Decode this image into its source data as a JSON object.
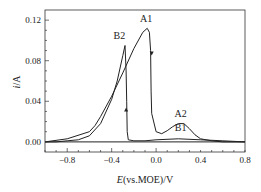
{
  "chart_data": {
    "type": "line",
    "title": "",
    "xlabel": "E(vs.MOE)/V",
    "xlabel_italic": "E",
    "xlabel_rest": "(vs.MOE)/V",
    "ylabel": "i/A",
    "ylabel_italic": "i",
    "ylabel_rest": "/A",
    "xlim": [
      -1.0,
      0.8
    ],
    "ylim": [
      -0.01,
      0.13
    ],
    "xticks": [
      -0.8,
      -0.4,
      0.0,
      0.4,
      0.8
    ],
    "xtick_labels": [
      "−0.8",
      "−0.4",
      "0.0",
      "0.4",
      "0.8"
    ],
    "yticks": [
      0.0,
      0.04,
      0.08,
      0.12
    ],
    "ytick_labels": [
      "0.00",
      "0.04",
      "0.08",
      "0.12"
    ],
    "grid": false,
    "legend": null,
    "annotations": [
      {
        "text": "A1",
        "x": -0.09,
        "y": 0.118
      },
      {
        "text": "B2",
        "x": -0.33,
        "y": 0.101
      },
      {
        "text": "A2",
        "x": 0.22,
        "y": 0.025
      },
      {
        "text": "B1",
        "x": 0.22,
        "y": 0.011
      }
    ],
    "series": [
      {
        "name": "Anodic sweep (A1, A2)",
        "x": [
          -1.0,
          -0.8,
          -0.6,
          -0.55,
          -0.5,
          -0.4,
          -0.3,
          -0.2,
          -0.12,
          -0.08,
          -0.06,
          -0.05,
          -0.045,
          -0.04,
          0.0,
          0.05,
          0.1,
          0.15,
          0.2,
          0.25,
          0.3,
          0.35,
          0.4,
          0.5,
          0.6,
          0.8
        ],
        "values": [
          0.0,
          0.003,
          0.01,
          0.016,
          0.025,
          0.045,
          0.068,
          0.092,
          0.108,
          0.112,
          0.108,
          0.09,
          0.05,
          0.028,
          0.01,
          0.008,
          0.011,
          0.015,
          0.018,
          0.018,
          0.013,
          0.007,
          0.003,
          0.001,
          0.0,
          0.0
        ]
      },
      {
        "name": "Cathodic sweep (B1, B2)",
        "x": [
          0.8,
          0.6,
          0.4,
          0.2,
          0.0,
          -0.1,
          -0.2,
          -0.25,
          -0.26,
          -0.265,
          -0.27,
          -0.28,
          -0.3,
          -0.35,
          -0.4,
          -0.5,
          -0.6,
          -0.7,
          -0.8,
          -0.9,
          -1.0
        ],
        "values": [
          0.0,
          0.001,
          0.002,
          0.003,
          0.002,
          0.001,
          0.001,
          0.002,
          0.01,
          0.04,
          0.07,
          0.095,
          0.085,
          0.06,
          0.042,
          0.018,
          0.006,
          0.002,
          0.001,
          0.0,
          0.0
        ]
      },
      {
        "name": "Baseline",
        "x": [
          -1.0,
          0.8
        ],
        "values": [
          0.0,
          0.0
        ]
      }
    ],
    "arrows": [
      {
        "x": -0.04,
        "y": 0.087,
        "direction": "down"
      },
      {
        "x": -0.27,
        "y": 0.032,
        "direction": "up"
      }
    ]
  }
}
